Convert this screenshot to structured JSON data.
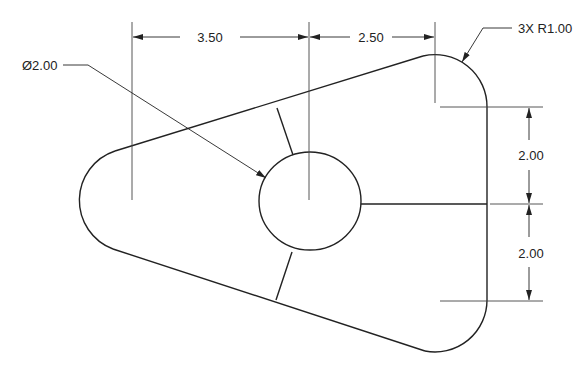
{
  "drawing": {
    "type": "mechanical-part-drawing",
    "line_color": "#222222",
    "background": "#ffffff"
  },
  "dimensions": {
    "horizontal_left": "3.50",
    "horizontal_right": "2.50",
    "vertical_upper": "2.00",
    "vertical_lower": "2.00",
    "hole_diameter": "Ø2.00",
    "corner_radius": "3X R1.00"
  },
  "geometry": {
    "left_arc_center": [
      132,
      200
    ],
    "top_right_arc_center": [
      435,
      107
    ],
    "bottom_right_arc_center": [
      435,
      300
    ],
    "corner_radius_px": 52,
    "hole_center": [
      310,
      200
    ],
    "hole_radius_px": 50
  }
}
